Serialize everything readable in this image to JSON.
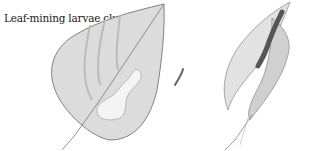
{
  "caption": "Leaf-mining larvae clue",
  "illustrations": [
    {
      "name": "mined-leaf",
      "description": "Leaf with pale serpentine blotch mine"
    },
    {
      "name": "larva",
      "description": "Small curved larva beside leaf"
    },
    {
      "name": "rolled-leaf-with-caterpillar",
      "description": "Folded leaf with caterpillar on stem"
    }
  ],
  "colors": {
    "ink": "#555555",
    "leaf_fill": "#d8d8d8",
    "mine_fill": "#f4f4f4",
    "background": "#ffffff"
  }
}
